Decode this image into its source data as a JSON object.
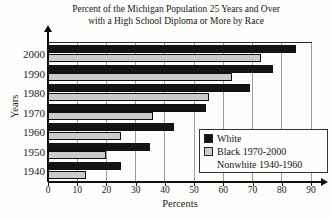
{
  "title": {
    "line1": "Percent of the Michigan Population 25 Years and Over",
    "line2": "with a High School Diploma or More by Race"
  },
  "chart_data": {
    "type": "bar",
    "orientation": "horizontal",
    "title": "Percent of the Michigan Population 25 Years and Over with a High School Diploma or More by Race",
    "categories": [
      "2000",
      "1990",
      "1980",
      "1970",
      "1960",
      "1950",
      "1940"
    ],
    "series": [
      {
        "name": "White",
        "color": "#141414",
        "values": [
          85,
          77,
          69,
          54,
          43,
          35,
          25
        ]
      },
      {
        "name": "Black 1970-2000 / Nonwhite 1940-1960",
        "color": "#cbcbcb",
        "values": [
          73,
          63,
          55,
          36,
          25,
          20,
          13
        ]
      }
    ],
    "xlabel": "Percents",
    "ylabel": "Years",
    "xlim": [
      0,
      90
    ],
    "xticks": [
      0,
      10,
      20,
      30,
      40,
      50,
      60,
      70,
      80,
      90
    ],
    "grid": true,
    "legend": {
      "position": "inside-right",
      "entries": [
        {
          "label": "White",
          "swatch": "#141414"
        },
        {
          "label": "Black 1970-2000",
          "swatch": "#cbcbcb"
        },
        {
          "label": "Nonwhite 1940-1960",
          "swatch": null
        }
      ]
    }
  }
}
